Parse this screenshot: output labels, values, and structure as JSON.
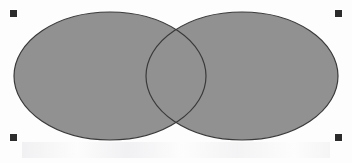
{
  "canvas": {
    "width": 352,
    "height": 163,
    "background_color": "#fdfdfd",
    "label": "Drawing canvas"
  },
  "diagram": {
    "kind": "venn-two-set",
    "fill_color": "#919191",
    "stroke_color": "#3a3a3a",
    "stroke_width": 1.2,
    "shapes": [
      {
        "name": "left-ellipse",
        "cx": 110,
        "cy": 76,
        "rx": 96,
        "ry": 64,
        "fill": "#919191",
        "stroke": "#3a3a3a"
      },
      {
        "name": "right-ellipse",
        "cx": 242,
        "cy": 76,
        "rx": 96,
        "ry": 64,
        "fill": "#919191",
        "stroke": "#3a3a3a"
      }
    ],
    "intersection": {
      "name": "overlap-lens",
      "top_point": {
        "x": 178,
        "y": 29
      },
      "bottom_point": {
        "x": 178,
        "y": 125
      },
      "fill": "#919191"
    }
  },
  "selection": {
    "active": true,
    "handle_color": "#2c2c2c",
    "handle_size": 7,
    "handles": [
      {
        "name": "handle-top-left",
        "x": 10,
        "y": 10,
        "cursor": "nwse-resize"
      },
      {
        "name": "handle-top-right",
        "x": 335,
        "y": 10,
        "cursor": "nesw-resize"
      },
      {
        "name": "handle-bottom-left",
        "x": 10,
        "y": 134,
        "cursor": "nesw-resize"
      },
      {
        "name": "handle-bottom-right",
        "x": 335,
        "y": 134,
        "cursor": "nwse-resize"
      }
    ],
    "bounds": {
      "x": 13,
      "y": 13,
      "width": 329,
      "height": 128
    }
  },
  "artifacts": {
    "scan_ghost_band": "faint horizontal scan/compression ghosting"
  }
}
